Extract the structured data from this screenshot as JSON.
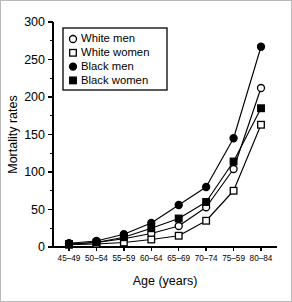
{
  "figure": {
    "border_color": "#b9b9b9",
    "background": "#ffffff"
  },
  "chart_data": {
    "type": "line",
    "title": "",
    "xlabel": "Age (years)",
    "ylabel": "Mortality rates",
    "categories": [
      "45–49",
      "50–54",
      "55–59",
      "60–64",
      "65–69",
      "70–74",
      "75–59",
      "80–84"
    ],
    "ylim": [
      0,
      300
    ],
    "ytick_labels": [
      "0",
      "50",
      "100",
      "150",
      "200",
      "250",
      "300"
    ],
    "ytick_values": [
      0,
      50,
      100,
      150,
      200,
      250,
      300
    ],
    "yminor_values": [
      25,
      75,
      125,
      175,
      225,
      275
    ],
    "grid": false,
    "legend_position": "upper-left",
    "series": [
      {
        "name": "White men",
        "marker": "open-circle",
        "color": "#000000",
        "values": [
          4,
          6,
          11,
          18,
          28,
          53,
          104,
          212
        ]
      },
      {
        "name": "White women",
        "marker": "open-square",
        "color": "#000000",
        "values": [
          3,
          4,
          6,
          10,
          15,
          35,
          75,
          163
        ]
      },
      {
        "name": "Black men",
        "marker": "filled-circle",
        "color": "#000000",
        "values": [
          5,
          8,
          17,
          32,
          56,
          80,
          145,
          267
        ]
      },
      {
        "name": "Black women",
        "marker": "filled-square",
        "color": "#000000",
        "values": [
          4,
          6,
          13,
          25,
          38,
          60,
          114,
          185
        ]
      }
    ]
  }
}
